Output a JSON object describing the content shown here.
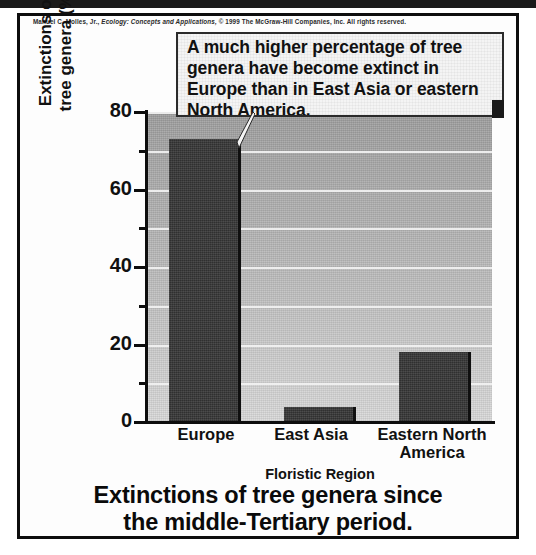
{
  "credit": {
    "author": "Manuel C. Molles, Jr.,",
    "title": "Ecology: Concepts and Applications,",
    "rights": "© 1999 The McGraw-Hill Companies, Inc. All rights reserved."
  },
  "callout": {
    "text": "A much higher percentage of tree genera have become extinct in Europe than in East Asia or eastern North America."
  },
  "caption": {
    "line1": "Extinctions of tree genera since",
    "line2": "the middle-Tertiary period."
  },
  "chart_data": {
    "type": "bar",
    "title": "Extinctions of tree genera since the middle-Tertiary period.",
    "categories": [
      "Europe",
      "East Asia",
      "Eastern North America"
    ],
    "values": [
      73,
      4,
      18
    ],
    "xlabel": "Floristic Region",
    "ylabel": "Extinctions of tree genera (%)",
    "ylabel_line1": "Extinctions of",
    "ylabel_line2": "tree genera (%)",
    "ylim": [
      0,
      80
    ],
    "ytick_major": [
      0,
      20,
      40,
      60,
      80
    ],
    "ytick_minor": [
      10,
      30,
      50,
      70
    ],
    "ytick_labels": [
      "0",
      "20",
      "40",
      "60",
      "80"
    ],
    "grid": true,
    "grid_orientation": "horizontal",
    "legend": false,
    "bar_color": "#3a3a3a",
    "panel_color": "#bdbdbd",
    "gridline_color": "#f2f2f2"
  },
  "xlabels": {
    "europe": "Europe",
    "east_asia": "East Asia",
    "enam_line1": "Eastern North",
    "enam_line2": "America"
  }
}
